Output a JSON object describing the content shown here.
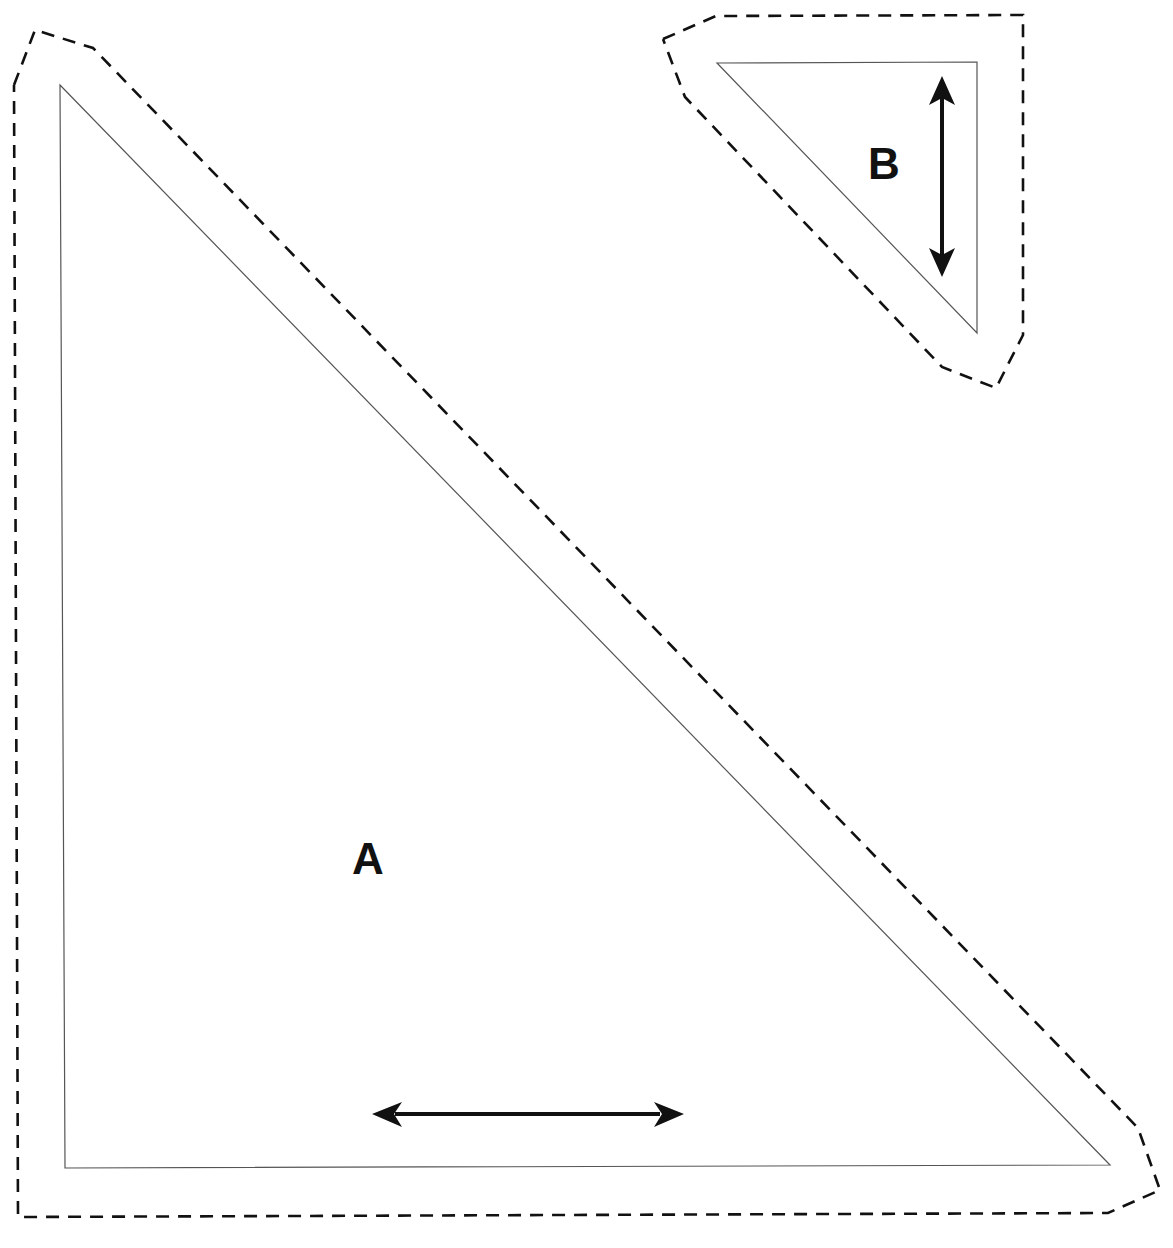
{
  "diagram": {
    "type": "sewing-pattern-pieces",
    "colors": {
      "background": "#ffffff",
      "cut_line": "#555555",
      "seam_allowance_line": "#111111",
      "grainline_arrow": "#111111",
      "label": "#111111"
    },
    "pieces": [
      {
        "id": "A",
        "label": "A",
        "shape": "right-triangle",
        "right_angle_corner": "bottom-left",
        "outline": "solid",
        "seam_allowance_outline": "dashed",
        "grainline": "horizontal"
      },
      {
        "id": "B",
        "label": "B",
        "shape": "right-triangle",
        "right_angle_corner": "top-right",
        "outline": "solid",
        "seam_allowance_outline": "dashed",
        "grainline": "vertical"
      }
    ]
  }
}
